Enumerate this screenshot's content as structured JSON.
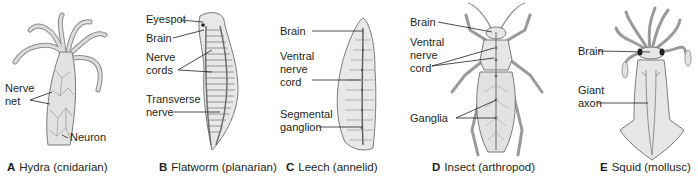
{
  "figure": {
    "panels": [
      {
        "letter": "A",
        "caption": "Hydra (cnidarian)",
        "labels": {
          "nerve_net": "Nerve\nnet",
          "neuron": "Neuron"
        }
      },
      {
        "letter": "B",
        "caption": "Flatworm (planarian)",
        "labels": {
          "eyespot": "Eyespot",
          "brain": "Brain",
          "nerve_cords": "Nerve\ncords",
          "transverse_nerve": "Transverse\nnerve"
        }
      },
      {
        "letter": "C",
        "caption": "Leech (annelid)",
        "labels": {
          "brain": "Brain",
          "ventral_nerve_cord": "Ventral\nnerve\ncord",
          "segmental_ganglion": "Segmental\nganglion"
        }
      },
      {
        "letter": "D",
        "caption": "Insect (arthropod)",
        "labels": {
          "brain": "Brain",
          "ventral_nerve_cord": "Ventral\nnerve\ncord",
          "ganglia": "Ganglia"
        }
      },
      {
        "letter": "E",
        "caption": "Squid (mollusc)",
        "labels": {
          "brain": "Brain",
          "giant_axon": "Giant\naxon"
        }
      }
    ],
    "colors": {
      "body_fill": "#e6e6e6",
      "body_stroke": "#7a7a7a",
      "nerve": "#5a5a5a",
      "leader_line": "#231f20",
      "text": "#231f20"
    }
  }
}
